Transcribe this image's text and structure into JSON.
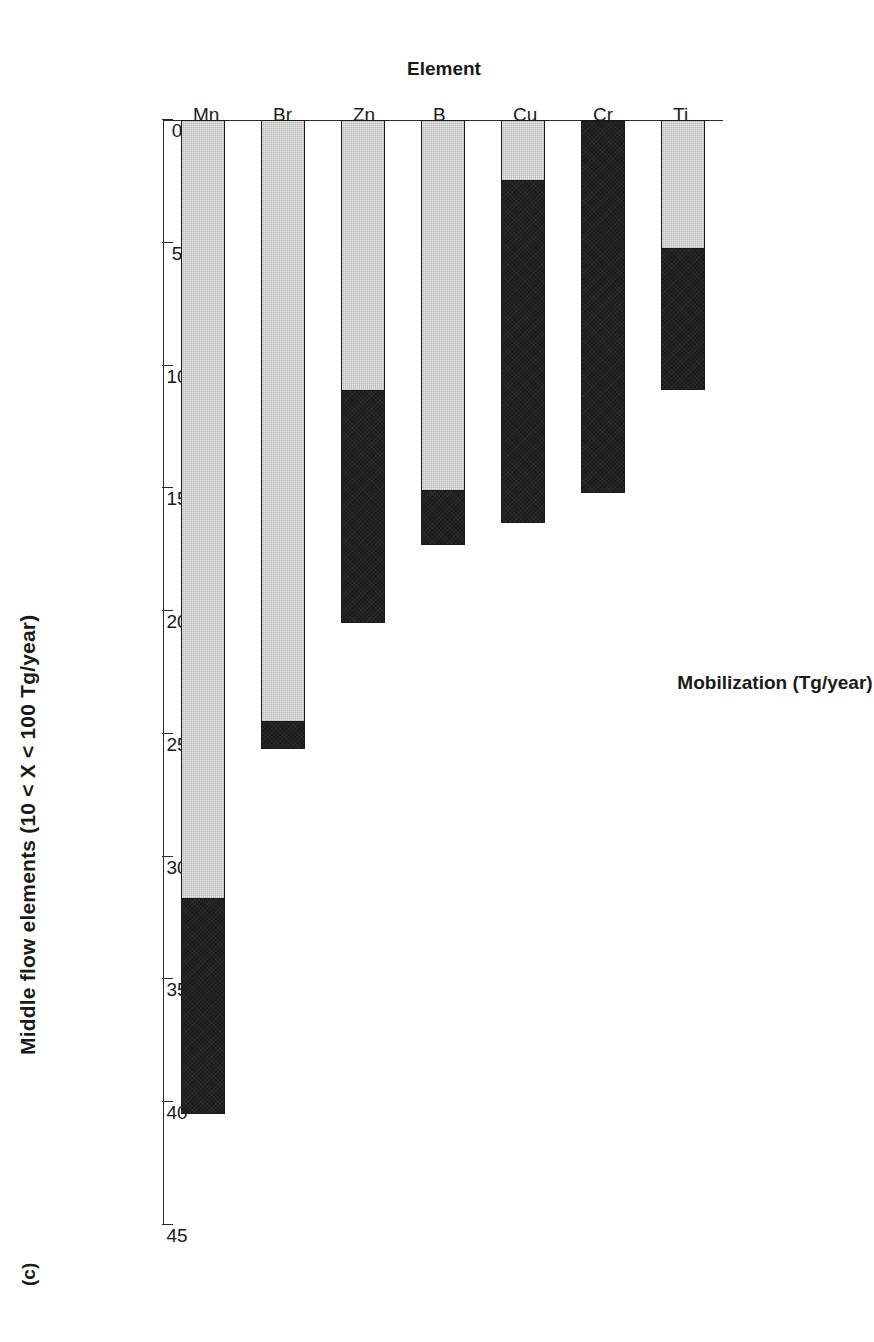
{
  "panel": {
    "label": "(c)"
  },
  "chart_data": {
    "type": "bar",
    "orientation": "horizontal-rotated",
    "title": "Middle flow elements (10 < X < 100 Tg/year)",
    "xlabel": "Element",
    "ylabel": "Mobilization (Tg/year)",
    "categories": [
      "Mn",
      "Br",
      "Zn",
      "B",
      "Cu",
      "Cr",
      "Ti"
    ],
    "ylim": [
      0,
      45
    ],
    "yticks": [
      0,
      5,
      10,
      15,
      20,
      25,
      30,
      35,
      40,
      45
    ],
    "ticklabels": [
      "0",
      "5",
      "10",
      "15",
      "20",
      "25",
      "30",
      "35",
      "40",
      "45"
    ],
    "grid": false,
    "legend": null,
    "stacked": true,
    "series": [
      {
        "name": "light-segment",
        "color": "#e8e8e8",
        "values": [
          31.7,
          24.5,
          11.0,
          15.1,
          2.4,
          0.0,
          5.2
        ]
      },
      {
        "name": "dark-segment",
        "color": "#1c1c1c",
        "values": [
          8.8,
          1.1,
          9.5,
          2.2,
          14.0,
          15.2,
          5.8
        ]
      }
    ],
    "totals": [
      40.5,
      25.6,
      20.5,
      17.3,
      16.4,
      15.2,
      11.0
    ]
  }
}
